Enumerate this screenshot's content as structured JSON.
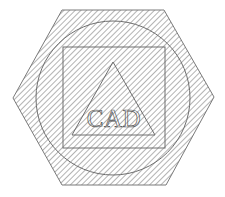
{
  "diagram": {
    "label": "CAD",
    "colors": {
      "background": "#ffffff",
      "hatch": "#8a8a8a",
      "outline": "#6e6e6e"
    },
    "hatch": {
      "spacing": 4,
      "angle_deg": 45
    },
    "shapes": {
      "hexagon": {
        "points": "62,10 164,10 214,97 166,185 62,185 13,98"
      },
      "circle": {
        "cx": 113,
        "cy": 98,
        "r": 77
      },
      "square": {
        "x": 63,
        "y": 47,
        "width": 102,
        "height": 101
      },
      "triangle": {
        "points": "113,62 155,135 72,135"
      },
      "text": {
        "x": 114,
        "y": 127
      }
    }
  }
}
